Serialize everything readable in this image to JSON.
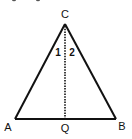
{
  "figure": {
    "vertices": {
      "apex": "C",
      "left": "A",
      "right": "B",
      "foot": "Q"
    },
    "angles": {
      "left_of_bisector": "1",
      "right_of_bisector": "2"
    },
    "segments": [
      {
        "name": "CA",
        "style": "solid"
      },
      {
        "name": "CB",
        "style": "solid"
      },
      {
        "name": "AB",
        "style": "solid"
      },
      {
        "name": "CQ",
        "style": "dotted"
      }
    ],
    "colors": {
      "stroke": "#111111",
      "background": "#ffffff"
    }
  }
}
